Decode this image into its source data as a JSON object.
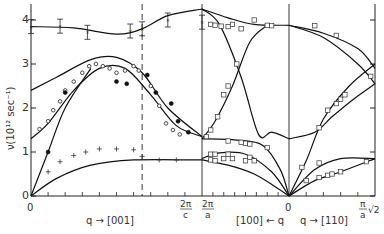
{
  "chart_data": {
    "type": "line",
    "title": "",
    "ylabel": "ν(10¹² sec⁻¹)",
    "ylim": [
      0,
      4.4
    ],
    "yticks": [
      "0",
      "1",
      "2",
      "3",
      "4"
    ],
    "xsections": [
      {
        "name": "q → [001]",
        "from": "0",
        "to": "2π/c"
      },
      {
        "name": "[100] ← q",
        "from": "2π/a",
        "to": "0"
      },
      {
        "name": "q → [110]",
        "from": "0",
        "to": "π/a √2"
      }
    ],
    "xtick_labels": {
      "origin": "0",
      "zone_c_num": "2π",
      "zone_c_den": "c",
      "zone_a_num": "2π",
      "zone_a_den": "a",
      "center": "0",
      "end_num": "π",
      "end_den": "a",
      "end_suffix": "√2"
    },
    "xaxis_labels": {
      "left": "q → [001]",
      "middle": "[100] ← q",
      "right": "q → [110]"
    },
    "note": "x coordinates are normalized: 0..1 = [001] (0 to 2π/a, dashed at 2π/c ≈ 0.65), 1..2 = [100] (2π/a back to 0), 2..3 = [110] (0 to π/a√2)",
    "dashed_line_x": 0.65,
    "series": [
      {
        "name": "curve-top-001",
        "style": "line",
        "points": [
          [
            0,
            3.85
          ],
          [
            0.25,
            3.82
          ],
          [
            0.5,
            3.68
          ],
          [
            0.65,
            3.8
          ],
          [
            0.8,
            4.1
          ],
          [
            1.0,
            4.25
          ]
        ]
      },
      {
        "name": "curve-upper-optic-001",
        "style": "line",
        "points": [
          [
            0,
            2.4
          ],
          [
            0.15,
            2.7
          ],
          [
            0.35,
            3.1
          ],
          [
            0.5,
            3.15
          ],
          [
            0.65,
            2.8
          ],
          [
            0.8,
            2.0
          ],
          [
            1.0,
            1.35
          ]
        ]
      },
      {
        "name": "curve-lower-optic-001",
        "style": "line",
        "points": [
          [
            0,
            1.3
          ],
          [
            0.1,
            1.65
          ],
          [
            0.25,
            2.4
          ],
          [
            0.4,
            2.9
          ],
          [
            0.55,
            2.9
          ],
          [
            0.7,
            2.3
          ],
          [
            0.85,
            1.6
          ],
          [
            1.0,
            1.35
          ]
        ]
      },
      {
        "name": "curve-acoustic-L-001",
        "style": "line",
        "points": [
          [
            0,
            0
          ],
          [
            0.1,
            1.0
          ],
          [
            0.2,
            2.0
          ],
          [
            0.35,
            2.9
          ]
        ]
      },
      {
        "name": "curve-acoustic-T-001",
        "style": "line",
        "points": [
          [
            0,
            0
          ],
          [
            0.15,
            0.4
          ],
          [
            0.35,
            0.7
          ],
          [
            0.6,
            0.82
          ],
          [
            1.0,
            0.82
          ]
        ]
      },
      {
        "name": "curve-top-100",
        "style": "line",
        "points": [
          [
            1.0,
            4.25
          ],
          [
            1.3,
            4.05
          ],
          [
            1.6,
            3.9
          ],
          [
            2.0,
            3.88
          ]
        ]
      },
      {
        "name": "curve-cross-a-100",
        "style": "line",
        "points": [
          [
            1.0,
            4.25
          ],
          [
            1.2,
            3.9
          ],
          [
            1.45,
            2.7
          ],
          [
            1.65,
            1.4
          ],
          [
            1.8,
            1.45
          ],
          [
            2.0,
            1.3
          ]
        ]
      },
      {
        "name": "curve-cross-b-100",
        "style": "line",
        "points": [
          [
            1.0,
            1.3
          ],
          [
            1.15,
            1.7
          ],
          [
            1.35,
            2.5
          ],
          [
            1.55,
            3.5
          ],
          [
            1.75,
            3.88
          ]
        ]
      },
      {
        "name": "curve-flat-100",
        "style": "line",
        "points": [
          [
            1.0,
            1.3
          ],
          [
            1.4,
            1.27
          ],
          [
            1.7,
            1.15
          ],
          [
            1.9,
            0.6
          ],
          [
            2.0,
            0
          ]
        ]
      },
      {
        "name": "curve-mid-100",
        "style": "line",
        "points": [
          [
            1.0,
            0.85
          ],
          [
            1.2,
            0.98
          ],
          [
            1.5,
            0.95
          ],
          [
            1.8,
            0.55
          ],
          [
            2.0,
            0
          ]
        ]
      },
      {
        "name": "curve-low-100",
        "style": "line",
        "points": [
          [
            1.0,
            0.82
          ],
          [
            1.3,
            0.7
          ],
          [
            1.6,
            0.5
          ],
          [
            1.85,
            0.2
          ],
          [
            2.0,
            0
          ]
        ]
      },
      {
        "name": "curve-top-110",
        "style": "line",
        "points": [
          [
            2.0,
            3.88
          ],
          [
            2.4,
            3.7
          ],
          [
            2.8,
            3.35
          ],
          [
            3.0,
            2.9
          ]
        ]
      },
      {
        "name": "curve-second-110",
        "style": "line",
        "points": [
          [
            2.0,
            3.88
          ],
          [
            2.4,
            3.6
          ],
          [
            2.8,
            3.0
          ],
          [
            3.0,
            2.55
          ]
        ]
      },
      {
        "name": "curve-rising-a-110",
        "style": "line",
        "points": [
          [
            2.0,
            0
          ],
          [
            2.2,
            0.8
          ],
          [
            2.4,
            1.75
          ],
          [
            2.7,
            2.5
          ],
          [
            3.0,
            3.0
          ]
        ]
      },
      {
        "name": "curve-rising-b-110",
        "style": "line",
        "points": [
          [
            2.0,
            1.3
          ],
          [
            2.3,
            1.45
          ],
          [
            2.5,
            1.8
          ],
          [
            2.75,
            2.2
          ],
          [
            3.0,
            2.55
          ]
        ]
      },
      {
        "name": "curve-acoustic-a-110",
        "style": "line",
        "points": [
          [
            2.0,
            0
          ],
          [
            2.3,
            0.6
          ],
          [
            2.6,
            0.85
          ],
          [
            3.0,
            0.85
          ]
        ]
      },
      {
        "name": "curve-acoustic-b-110",
        "style": "line",
        "points": [
          [
            2.0,
            0
          ],
          [
            2.3,
            0.35
          ],
          [
            2.6,
            0.55
          ],
          [
            3.0,
            0.85
          ]
        ]
      }
    ],
    "markers": {
      "errorbar_x": [
        [
          0,
          3.85
        ],
        [
          0.17,
          3.86
        ],
        [
          0.33,
          3.72
        ],
        [
          0.58,
          3.75
        ],
        [
          0.65,
          3.8
        ],
        [
          0.8,
          4.0
        ],
        [
          1.0,
          3.95
        ]
      ],
      "open_circles": [
        [
          0.05,
          1.52
        ],
        [
          0.1,
          1.7
        ],
        [
          0.13,
          1.95
        ],
        [
          0.17,
          2.15
        ],
        [
          0.2,
          2.4
        ],
        [
          0.25,
          2.6
        ],
        [
          0.3,
          2.8
        ],
        [
          0.34,
          2.95
        ],
        [
          0.38,
          3.0
        ],
        [
          0.42,
          2.95
        ],
        [
          0.46,
          2.9
        ],
        [
          0.5,
          2.8
        ],
        [
          0.55,
          2.85
        ],
        [
          0.6,
          2.95
        ],
        [
          0.63,
          2.85
        ],
        [
          0.7,
          2.5
        ],
        [
          0.75,
          2.05
        ],
        [
          0.79,
          1.65
        ],
        [
          0.83,
          1.5
        ],
        [
          0.87,
          1.4
        ]
      ],
      "filled_circles": [
        [
          0.1,
          1.0
        ],
        [
          0.2,
          2.35
        ],
        [
          0.5,
          2.6
        ],
        [
          0.56,
          2.55
        ],
        [
          0.68,
          2.75
        ],
        [
          0.73,
          2.35
        ],
        [
          0.82,
          2.1
        ],
        [
          0.86,
          1.7
        ],
        [
          0.92,
          1.45
        ]
      ],
      "plus": [
        [
          0.1,
          0.55
        ],
        [
          0.17,
          0.78
        ],
        [
          0.25,
          0.92
        ],
        [
          0.32,
          1.0
        ],
        [
          0.4,
          1.07
        ],
        [
          0.5,
          1.07
        ],
        [
          0.6,
          1.05
        ],
        [
          0.65,
          0.9
        ],
        [
          0.75,
          0.82
        ],
        [
          0.85,
          0.82
        ]
      ],
      "squares": [
        [
          1.05,
          1.35
        ],
        [
          1.1,
          1.5
        ],
        [
          1.18,
          1.8
        ],
        [
          1.25,
          2.3
        ],
        [
          1.3,
          2.5
        ],
        [
          1.4,
          3.0
        ],
        [
          1.1,
          3.9
        ],
        [
          1.15,
          3.88
        ],
        [
          1.22,
          3.86
        ],
        [
          1.3,
          3.85
        ],
        [
          1.35,
          3.9
        ],
        [
          1.45,
          3.8
        ],
        [
          1.6,
          4.0
        ],
        [
          1.75,
          3.88
        ],
        [
          1.8,
          3.87
        ],
        [
          1.3,
          1.25
        ],
        [
          1.45,
          1.22
        ],
        [
          1.5,
          1.2
        ],
        [
          1.55,
          1.18
        ],
        [
          1.75,
          1.1
        ],
        [
          1.1,
          0.95
        ],
        [
          1.15,
          0.95
        ],
        [
          1.3,
          0.95
        ],
        [
          1.55,
          0.88
        ],
        [
          1.1,
          0.82
        ],
        [
          1.15,
          0.8
        ],
        [
          1.25,
          0.85
        ],
        [
          1.35,
          0.85
        ],
        [
          1.5,
          0.8
        ],
        [
          1.6,
          0.8
        ],
        [
          2.3,
          3.87
        ],
        [
          2.55,
          3.65
        ],
        [
          2.95,
          2.72
        ],
        [
          2.35,
          1.55
        ],
        [
          2.45,
          1.95
        ],
        [
          2.55,
          2.1
        ],
        [
          2.6,
          2.2
        ],
        [
          2.65,
          2.3
        ],
        [
          2.15,
          0.65
        ],
        [
          2.35,
          0.75
        ],
        [
          2.2,
          0.35
        ],
        [
          2.35,
          0.42
        ],
        [
          2.45,
          0.47
        ],
        [
          2.5,
          0.5
        ],
        [
          2.6,
          0.55
        ],
        [
          2.9,
          0.78
        ]
      ]
    }
  }
}
